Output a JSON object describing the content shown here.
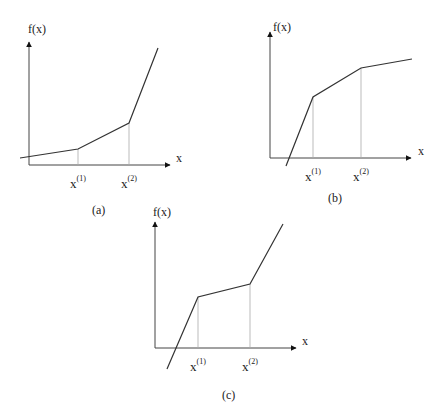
{
  "panels": [
    {
      "id": "a",
      "caption": "(a)",
      "y_label": "f(x)",
      "x_label": "x",
      "breakpoints": [
        {
          "base": "x",
          "sup": "(1)"
        },
        {
          "base": "x",
          "sup": "(2)"
        }
      ],
      "description": "convex piecewise-linear, slopes increasing"
    },
    {
      "id": "b",
      "caption": "(b)",
      "y_label": "f(x)",
      "x_label": "x",
      "breakpoints": [
        {
          "base": "x",
          "sup": "(1)"
        },
        {
          "base": "x",
          "sup": "(2)"
        }
      ],
      "description": "concave piecewise-linear, slopes decreasing"
    },
    {
      "id": "c",
      "caption": "(c)",
      "y_label": "f(x)",
      "x_label": "x",
      "breakpoints": [
        {
          "base": "x",
          "sup": "(1)"
        },
        {
          "base": "x",
          "sup": "(2)"
        }
      ],
      "description": "piecewise-linear, steep-shallow-steep"
    }
  ],
  "colors": {
    "line": "#333333",
    "guide": "#999999",
    "text": "#222222"
  }
}
